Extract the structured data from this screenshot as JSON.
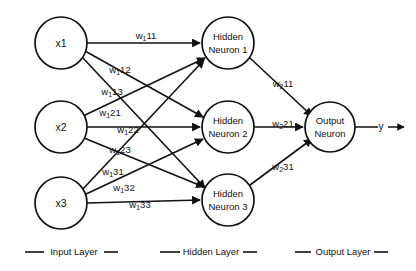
{
  "diagram": {
    "background_color": "#ffffff",
    "stroke_color": "#111111",
    "input_layer": {
      "nodes": [
        {
          "id": "x1",
          "label": "x1",
          "cx": 61,
          "cy": 43,
          "r": 26
        },
        {
          "id": "x2",
          "label": "x2",
          "cx": 61,
          "cy": 127,
          "r": 26
        },
        {
          "id": "x3",
          "label": "x3",
          "cx": 61,
          "cy": 203,
          "r": 26
        }
      ]
    },
    "hidden_layer": {
      "nodes": [
        {
          "id": "h1",
          "line1": "Hidden",
          "line2": "Neuron 1",
          "cx": 228,
          "cy": 43,
          "r": 26
        },
        {
          "id": "h2",
          "line1": "Hidden",
          "line2": "Neuron 2",
          "cx": 228,
          "cy": 127,
          "r": 26
        },
        {
          "id": "h3",
          "line1": "Hidden",
          "line2": "Neuron 3",
          "cx": 228,
          "cy": 200,
          "r": 26
        }
      ]
    },
    "output_layer": {
      "nodes": [
        {
          "id": "o1",
          "line1": "Output",
          "line2": "Neuron",
          "cx": 330,
          "cy": 127,
          "r": 25
        }
      ],
      "output_signal_label": "y"
    },
    "input_to_hidden_weights": [
      {
        "id": "w111",
        "base": "w",
        "sub": "1",
        "post": "11",
        "from": "x1",
        "to": "h1",
        "lx": 146,
        "ly": 36
      },
      {
        "id": "w112",
        "base": "w",
        "sub": "1",
        "post": "12",
        "from": "x1",
        "to": "h2",
        "lx": 120,
        "ly": 70
      },
      {
        "id": "w113",
        "base": "w",
        "sub": "1",
        "post": "13",
        "from": "x1",
        "to": "h3",
        "lx": 112,
        "ly": 92
      },
      {
        "id": "w121",
        "base": "w",
        "sub": "1",
        "post": "21",
        "from": "x2",
        "to": "h1",
        "lx": 110,
        "ly": 113
      },
      {
        "id": "w122",
        "base": "w",
        "sub": "1",
        "post": "22",
        "from": "x2",
        "to": "h2",
        "lx": 128,
        "ly": 130
      },
      {
        "id": "w123",
        "base": "w",
        "sub": "1",
        "post": "23",
        "from": "x2",
        "to": "h3",
        "lx": 120,
        "ly": 150
      },
      {
        "id": "w131",
        "base": "w",
        "sub": "1",
        "post": "31",
        "from": "x3",
        "to": "h1",
        "lx": 113,
        "ly": 172
      },
      {
        "id": "w132",
        "base": "w",
        "sub": "1",
        "post": "32",
        "from": "x3",
        "to": "h2",
        "lx": 124,
        "ly": 188
      },
      {
        "id": "w133",
        "base": "w",
        "sub": "1",
        "post": "33",
        "from": "x3",
        "to": "h3",
        "lx": 140,
        "ly": 205
      }
    ],
    "hidden_to_output_weights": [
      {
        "id": "w211",
        "base": "w",
        "sub": "2",
        "post": "11",
        "from": "h1",
        "to": "o1",
        "lx": 283,
        "ly": 84
      },
      {
        "id": "w221",
        "base": "w",
        "sub": "2",
        "post": "21",
        "from": "h2",
        "to": "o1",
        "lx": 283,
        "ly": 124
      },
      {
        "id": "w231",
        "base": "w",
        "sub": "2",
        "post": "31",
        "from": "h3",
        "to": "o1",
        "lx": 283,
        "ly": 167
      }
    ],
    "legend": {
      "items": [
        {
          "id": "input-layer",
          "label": "Input Layer",
          "cx": 71,
          "y": 252
        },
        {
          "id": "hidden-layer",
          "label": "Hidden Layer",
          "cx": 208,
          "y": 252
        },
        {
          "id": "output-layer",
          "label": "Output Layer",
          "cx": 341,
          "y": 252
        }
      ]
    }
  }
}
